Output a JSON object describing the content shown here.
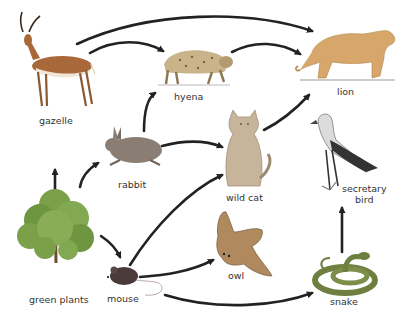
{
  "diagram": {
    "type": "food-web",
    "organisms": [
      {
        "id": "gazelle",
        "label": "gazelle"
      },
      {
        "id": "hyena",
        "label": "hyena"
      },
      {
        "id": "lion",
        "label": "lion"
      },
      {
        "id": "rabbit",
        "label": "rabbit"
      },
      {
        "id": "wild_cat",
        "label": "wild cat"
      },
      {
        "id": "secretary_bird",
        "label_line1": "secretary",
        "label_line2": "bird"
      },
      {
        "id": "green_plants",
        "label": "green plants"
      },
      {
        "id": "mouse",
        "label": "mouse"
      },
      {
        "id": "owl",
        "label": "owl"
      },
      {
        "id": "snake",
        "label": "snake"
      }
    ],
    "arrows": [
      {
        "from": "gazelle",
        "to": "lion"
      },
      {
        "from": "gazelle",
        "to": "hyena"
      },
      {
        "from": "hyena",
        "to": "lion"
      },
      {
        "from": "rabbit",
        "to": "hyena"
      },
      {
        "from": "rabbit",
        "to": "wild cat"
      },
      {
        "from": "wild cat",
        "to": "lion"
      },
      {
        "from": "green plants",
        "to": "gazelle"
      },
      {
        "from": "green plants",
        "to": "rabbit"
      },
      {
        "from": "green plants",
        "to": "mouse"
      },
      {
        "from": "mouse",
        "to": "wild cat"
      },
      {
        "from": "mouse",
        "to": "owl"
      },
      {
        "from": "mouse",
        "to": "snake"
      },
      {
        "from": "snake",
        "to": "secretary bird"
      }
    ],
    "colors": {
      "arrow": "#222222",
      "label": "#333333",
      "plant": "#7aa04a",
      "gazelle": "#a9683a",
      "hyena": "#c9b48a",
      "lion": "#d6a66a",
      "rabbit": "#8a7e74",
      "wild_cat": "#c6b59a",
      "owl": "#b08a5e",
      "snake": "#6f7f3f",
      "mouse": "#4a3a3a",
      "bird": "#777777"
    }
  }
}
